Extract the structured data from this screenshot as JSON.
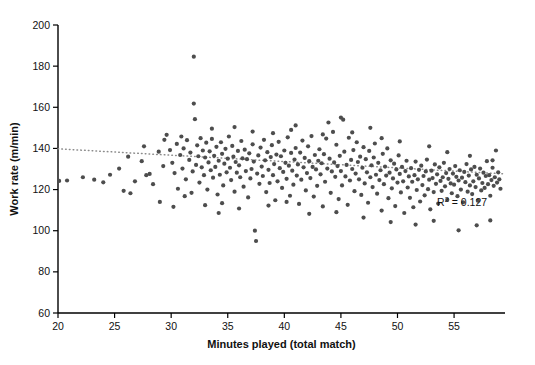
{
  "chart_data": {
    "type": "scatter",
    "title": "",
    "xlabel": "Minutes played (total match)",
    "ylabel": "Work rate (m/min)",
    "xlim": [
      20,
      59.5
    ],
    "ylim": [
      60,
      200
    ],
    "xticks": [
      20,
      25,
      30,
      35,
      40,
      45,
      50,
      55
    ],
    "yticks": [
      60,
      80,
      100,
      120,
      140,
      160,
      180,
      200
    ],
    "grid": false,
    "legend": null,
    "annotations": [
      {
        "name": "r-squared",
        "text": "R2 = 0.127",
        "display": "R",
        "sup": "2",
        "rest": " = 0.127",
        "x": 53.5,
        "y": 112
      }
    ],
    "trendline": {
      "style": "dotted",
      "color": "#8c8c8c",
      "x": [
        20,
        59.5
      ],
      "y": [
        139.8,
        127.6
      ]
    },
    "marker": {
      "shape": "circle",
      "color": "#4d4d4d",
      "size": 4.2
    },
    "points": [
      [
        20.1,
        124.2
      ],
      [
        20.8,
        124.4
      ],
      [
        24.0,
        123.5
      ],
      [
        25.4,
        130.2
      ],
      [
        26.2,
        136.0
      ],
      [
        26.4,
        118.2
      ],
      [
        27.4,
        133.8
      ],
      [
        27.6,
        141.0
      ],
      [
        28.1,
        127.6
      ],
      [
        28.4,
        122.6
      ],
      [
        28.9,
        138.4
      ],
      [
        29.0,
        114.0
      ],
      [
        29.3,
        131.4
      ],
      [
        29.6,
        146.6
      ],
      [
        29.9,
        139.2
      ],
      [
        30.1,
        133.0
      ],
      [
        30.3,
        128.0
      ],
      [
        30.5,
        142.2
      ],
      [
        30.6,
        120.4
      ],
      [
        30.8,
        136.8
      ],
      [
        31.0,
        130.2
      ],
      [
        31.1,
        140.0
      ],
      [
        31.3,
        125.0
      ],
      [
        31.4,
        144.0
      ],
      [
        31.6,
        134.4
      ],
      [
        31.7,
        138.0
      ],
      [
        31.9,
        128.8
      ],
      [
        32.0,
        184.6
      ],
      [
        32.0,
        161.8
      ],
      [
        32.1,
        154.2
      ],
      [
        32.2,
        132.0
      ],
      [
        32.3,
        141.5
      ],
      [
        32.4,
        136.2
      ],
      [
        32.5,
        123.4
      ],
      [
        32.6,
        145.0
      ],
      [
        32.7,
        130.8
      ],
      [
        32.8,
        139.0
      ],
      [
        32.9,
        127.0
      ],
      [
        33.0,
        135.6
      ],
      [
        33.1,
        142.8
      ],
      [
        33.2,
        120.0
      ],
      [
        33.3,
        133.2
      ],
      [
        33.4,
        138.6
      ],
      [
        33.5,
        129.4
      ],
      [
        33.6,
        144.6
      ],
      [
        33.7,
        125.8
      ],
      [
        33.8,
        136.4
      ],
      [
        33.9,
        131.0
      ],
      [
        34.0,
        140.8
      ],
      [
        34.1,
        117.6
      ],
      [
        34.2,
        134.0
      ],
      [
        34.3,
        127.2
      ],
      [
        34.4,
        143.0
      ],
      [
        34.5,
        137.4
      ],
      [
        34.6,
        122.0
      ],
      [
        34.7,
        132.6
      ],
      [
        34.8,
        139.8
      ],
      [
        34.9,
        128.4
      ],
      [
        35.0,
        135.0
      ],
      [
        35.1,
        145.8
      ],
      [
        35.2,
        130.6
      ],
      [
        35.3,
        124.6
      ],
      [
        35.4,
        141.2
      ],
      [
        35.5,
        136.0
      ],
      [
        35.6,
        119.0
      ],
      [
        35.7,
        133.4
      ],
      [
        35.8,
        128.2
      ],
      [
        35.9,
        138.8
      ],
      [
        36.0,
        131.8
      ],
      [
        36.1,
        126.0
      ],
      [
        36.2,
        143.6
      ],
      [
        36.3,
        135.2
      ],
      [
        36.4,
        121.4
      ],
      [
        36.5,
        139.4
      ],
      [
        36.6,
        129.0
      ],
      [
        36.7,
        134.8
      ],
      [
        36.8,
        116.2
      ],
      [
        36.9,
        137.6
      ],
      [
        37.0,
        125.4
      ],
      [
        37.1,
        130.0
      ],
      [
        37.2,
        142.0
      ],
      [
        37.3,
        133.6
      ],
      [
        37.4,
        100.0
      ],
      [
        37.5,
        95.0
      ],
      [
        37.6,
        127.8
      ],
      [
        37.7,
        136.6
      ],
      [
        37.8,
        122.8
      ],
      [
        37.9,
        140.4
      ],
      [
        38.0,
        131.2
      ],
      [
        38.1,
        126.6
      ],
      [
        38.2,
        144.2
      ],
      [
        38.3,
        134.2
      ],
      [
        38.4,
        118.8
      ],
      [
        38.5,
        138.2
      ],
      [
        38.6,
        129.6
      ],
      [
        38.7,
        123.2
      ],
      [
        38.8,
        135.8
      ],
      [
        38.9,
        141.6
      ],
      [
        39.0,
        127.0
      ],
      [
        39.1,
        132.4
      ],
      [
        39.2,
        114.8
      ],
      [
        39.3,
        137.0
      ],
      [
        39.4,
        124.0
      ],
      [
        39.5,
        143.2
      ],
      [
        39.6,
        130.4
      ],
      [
        39.7,
        136.2
      ],
      [
        39.8,
        120.8
      ],
      [
        39.9,
        128.6
      ],
      [
        40.0,
        139.0
      ],
      [
        40.1,
        133.0
      ],
      [
        40.2,
        125.2
      ],
      [
        40.3,
        145.4
      ],
      [
        40.4,
        131.6
      ],
      [
        40.5,
        117.0
      ],
      [
        40.6,
        137.8
      ],
      [
        40.7,
        129.2
      ],
      [
        40.8,
        122.4
      ],
      [
        40.9,
        134.6
      ],
      [
        41.0,
        140.2
      ],
      [
        41.1,
        126.8
      ],
      [
        41.2,
        132.2
      ],
      [
        41.3,
        113.0
      ],
      [
        41.4,
        138.0
      ],
      [
        41.5,
        124.8
      ],
      [
        41.6,
        143.8
      ],
      [
        41.7,
        130.8
      ],
      [
        41.8,
        135.4
      ],
      [
        41.9,
        119.6
      ],
      [
        42.0,
        128.0
      ],
      [
        42.1,
        141.0
      ],
      [
        42.2,
        133.8
      ],
      [
        42.3,
        125.6
      ],
      [
        42.4,
        146.0
      ],
      [
        42.5,
        131.0
      ],
      [
        42.6,
        116.6
      ],
      [
        42.7,
        136.8
      ],
      [
        42.8,
        129.8
      ],
      [
        42.9,
        121.8
      ],
      [
        43.0,
        134.0
      ],
      [
        43.1,
        139.6
      ],
      [
        43.2,
        127.4
      ],
      [
        43.3,
        132.8
      ],
      [
        43.4,
        111.8
      ],
      [
        43.5,
        137.2
      ],
      [
        43.6,
        123.8
      ],
      [
        43.7,
        144.8
      ],
      [
        43.8,
        130.2
      ],
      [
        43.9,
        152.6
      ],
      [
        44.0,
        135.0
      ],
      [
        44.1,
        118.4
      ],
      [
        44.2,
        128.8
      ],
      [
        44.3,
        148.0
      ],
      [
        44.4,
        133.2
      ],
      [
        44.5,
        126.2
      ],
      [
        44.6,
        141.8
      ],
      [
        44.7,
        131.4
      ],
      [
        44.8,
        115.4
      ],
      [
        44.9,
        136.4
      ],
      [
        45.0,
        129.0
      ],
      [
        45.1,
        122.0
      ],
      [
        45.2,
        154.0
      ],
      [
        45.3,
        138.4
      ],
      [
        45.4,
        126.4
      ],
      [
        45.5,
        132.0
      ],
      [
        45.6,
        112.6
      ],
      [
        45.7,
        145.2
      ],
      [
        45.8,
        124.4
      ],
      [
        45.9,
        134.4
      ],
      [
        46.0,
        130.0
      ],
      [
        46.1,
        139.2
      ],
      [
        46.2,
        119.2
      ],
      [
        46.3,
        127.8
      ],
      [
        46.4,
        143.0
      ],
      [
        46.5,
        133.4
      ],
      [
        46.6,
        125.0
      ],
      [
        46.7,
        136.0
      ],
      [
        46.8,
        117.4
      ],
      [
        46.9,
        130.6
      ],
      [
        47.0,
        140.6
      ],
      [
        47.1,
        123.0
      ],
      [
        47.2,
        134.8
      ],
      [
        47.3,
        128.4
      ],
      [
        47.4,
        113.6
      ],
      [
        47.5,
        138.8
      ],
      [
        47.6,
        126.0
      ],
      [
        47.7,
        131.8
      ],
      [
        47.8,
        121.2
      ],
      [
        47.9,
        135.6
      ],
      [
        48.0,
        142.4
      ],
      [
        48.1,
        127.2
      ],
      [
        48.2,
        118.0
      ],
      [
        48.3,
        133.0
      ],
      [
        48.4,
        124.6
      ],
      [
        48.5,
        129.4
      ],
      [
        48.6,
        109.8
      ],
      [
        48.7,
        137.4
      ],
      [
        48.8,
        122.6
      ],
      [
        48.9,
        131.2
      ],
      [
        49.0,
        126.8
      ],
      [
        49.1,
        140.0
      ],
      [
        49.2,
        115.8
      ],
      [
        49.3,
        128.2
      ],
      [
        49.4,
        134.2
      ],
      [
        49.5,
        120.6
      ],
      [
        49.6,
        125.4
      ],
      [
        49.7,
        132.6
      ],
      [
        49.8,
        112.0
      ],
      [
        49.9,
        129.8
      ],
      [
        50.0,
        123.4
      ],
      [
        50.1,
        136.6
      ],
      [
        50.2,
        127.6
      ],
      [
        50.3,
        118.6
      ],
      [
        50.4,
        131.0
      ],
      [
        50.5,
        124.0
      ],
      [
        50.6,
        108.6
      ],
      [
        50.7,
        129.0
      ],
      [
        50.8,
        134.0
      ],
      [
        50.9,
        121.0
      ],
      [
        51.0,
        126.4
      ],
      [
        51.1,
        116.0
      ],
      [
        51.2,
        130.4
      ],
      [
        51.3,
        123.8
      ],
      [
        51.4,
        111.4
      ],
      [
        51.5,
        127.0
      ],
      [
        51.6,
        133.6
      ],
      [
        51.7,
        119.8
      ],
      [
        51.8,
        125.0
      ],
      [
        51.9,
        129.6
      ],
      [
        52.0,
        114.2
      ],
      [
        52.1,
        131.6
      ],
      [
        52.2,
        122.2
      ],
      [
        52.3,
        126.6
      ],
      [
        52.4,
        117.2
      ],
      [
        52.5,
        128.8
      ],
      [
        52.6,
        134.6
      ],
      [
        52.7,
        120.2
      ],
      [
        52.8,
        124.8
      ],
      [
        52.9,
        110.4
      ],
      [
        53.0,
        129.2
      ],
      [
        53.1,
        125.6
      ],
      [
        53.2,
        118.8
      ],
      [
        53.3,
        132.2
      ],
      [
        53.4,
        122.8
      ],
      [
        53.5,
        127.4
      ],
      [
        53.6,
        113.2
      ],
      [
        53.7,
        130.8
      ],
      [
        53.8,
        124.2
      ],
      [
        53.9,
        119.4
      ],
      [
        54.0,
        126.0
      ],
      [
        54.1,
        133.0
      ],
      [
        54.2,
        121.6
      ],
      [
        54.3,
        128.0
      ],
      [
        54.4,
        115.0
      ],
      [
        54.5,
        125.2
      ],
      [
        54.6,
        130.0
      ],
      [
        54.7,
        123.0
      ],
      [
        54.8,
        118.2
      ],
      [
        54.9,
        127.8
      ],
      [
        55.0,
        122.4
      ],
      [
        55.1,
        131.4
      ],
      [
        55.2,
        126.2
      ],
      [
        55.3,
        116.8
      ],
      [
        55.4,
        124.4
      ],
      [
        55.5,
        129.4
      ],
      [
        55.6,
        120.0
      ],
      [
        55.7,
        125.8
      ],
      [
        55.8,
        113.8
      ],
      [
        55.9,
        128.6
      ],
      [
        56.0,
        123.6
      ],
      [
        56.1,
        132.4
      ],
      [
        56.2,
        119.0
      ],
      [
        56.3,
        126.8
      ],
      [
        56.4,
        122.0
      ],
      [
        56.5,
        129.8
      ],
      [
        56.6,
        117.8
      ],
      [
        56.7,
        124.0
      ],
      [
        56.8,
        131.0
      ],
      [
        56.9,
        121.2
      ],
      [
        57.0,
        127.2
      ],
      [
        57.1,
        114.6
      ],
      [
        57.2,
        125.4
      ],
      [
        57.3,
        130.2
      ],
      [
        57.4,
        119.6
      ],
      [
        57.5,
        123.2
      ],
      [
        57.6,
        128.2
      ],
      [
        57.7,
        120.8
      ],
      [
        57.8,
        126.6
      ],
      [
        57.9,
        133.8
      ],
      [
        58.0,
        122.6
      ],
      [
        58.1,
        127.0
      ],
      [
        58.2,
        117.0
      ],
      [
        58.3,
        124.6
      ],
      [
        58.4,
        130.6
      ],
      [
        58.5,
        121.8
      ],
      [
        58.6,
        126.0
      ],
      [
        58.7,
        139.0
      ],
      [
        58.8,
        123.4
      ],
      [
        58.9,
        128.4
      ],
      [
        59.0,
        125.0
      ],
      [
        59.1,
        120.4
      ],
      [
        30.2,
        111.6
      ],
      [
        31.2,
        116.8
      ],
      [
        33.0,
        112.4
      ],
      [
        34.5,
        113.4
      ],
      [
        36.0,
        110.8
      ],
      [
        42.2,
        108.2
      ],
      [
        44.6,
        109.0
      ],
      [
        47.0,
        106.4
      ],
      [
        49.4,
        104.2
      ],
      [
        51.6,
        103.0
      ],
      [
        53.2,
        104.8
      ],
      [
        55.4,
        100.2
      ],
      [
        57.0,
        102.6
      ],
      [
        58.2,
        105.0
      ],
      [
        39.0,
        147.4
      ],
      [
        40.6,
        149.0
      ],
      [
        43.4,
        146.8
      ],
      [
        46.0,
        147.8
      ],
      [
        48.6,
        145.0
      ],
      [
        50.2,
        143.4
      ],
      [
        52.8,
        141.0
      ],
      [
        54.4,
        138.2
      ],
      [
        56.4,
        136.4
      ],
      [
        58.4,
        134.2
      ],
      [
        35.6,
        150.4
      ],
      [
        37.2,
        148.2
      ],
      [
        29.4,
        144.2
      ],
      [
        27.8,
        127.0
      ],
      [
        26.8,
        124.0
      ],
      [
        25.8,
        119.4
      ],
      [
        24.6,
        127.2
      ],
      [
        23.2,
        124.8
      ],
      [
        22.2,
        126.0
      ],
      [
        30.9,
        145.8
      ],
      [
        33.6,
        149.6
      ],
      [
        41.0,
        151.2
      ],
      [
        45.0,
        155.0
      ],
      [
        47.6,
        150.0
      ],
      [
        31.8,
        118.4
      ],
      [
        34.2,
        108.6
      ],
      [
        38.6,
        112.2
      ],
      [
        40.2,
        114.0
      ]
    ]
  },
  "caption": {
    "partial_line": ""
  }
}
